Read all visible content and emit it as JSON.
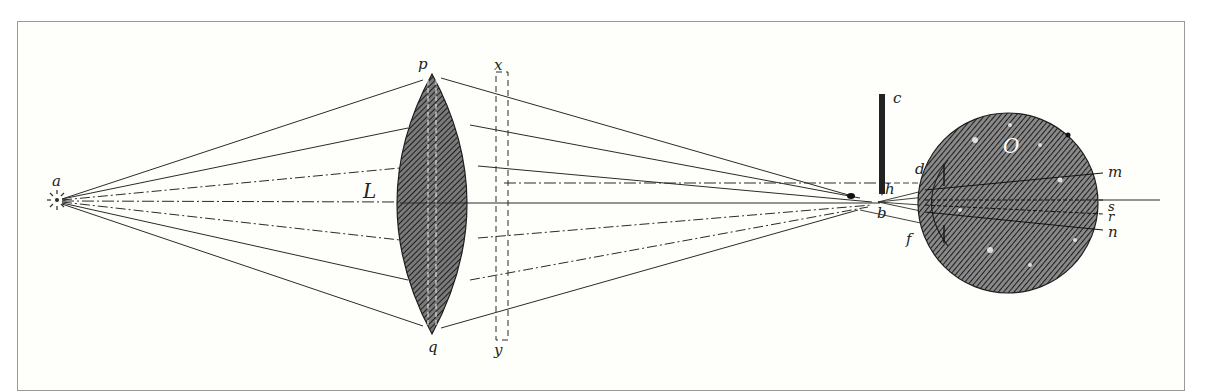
{
  "figure": {
    "frame_color": "#9a9a96",
    "background": "#fefefb",
    "ink": "#2a2a2a"
  },
  "labels": {
    "source": "a",
    "lens": "L",
    "lens_top": "p",
    "lens_bottom": "q",
    "screen_top": "x",
    "screen_bottom": "y",
    "rod": "c",
    "focus_upper": "h",
    "focus_lower": "b",
    "iris_upper": "d",
    "iris_lower": "f",
    "eye": "O",
    "eye_label_m": "m",
    "eye_label_s": "s",
    "eye_label_r": "r",
    "eye_label_n": "n",
    "lens_inner": "g"
  },
  "elements": {
    "point_source": {
      "name": "a",
      "x": 57,
      "y": 200
    },
    "lens": {
      "name": "L",
      "cx": 432,
      "top": 75,
      "bottom": 332,
      "half_width": 40
    },
    "screen": {
      "name": "x-y",
      "x1": 496,
      "x2": 508,
      "top": 85,
      "bottom": 338
    },
    "rod": {
      "name": "c",
      "x": 882,
      "top": 94,
      "bottom": 194
    },
    "focus_point": {
      "x": 878,
      "y": 202
    },
    "eye": {
      "name": "O",
      "cx": 1008,
      "cy": 200,
      "r": 90
    },
    "optical_axis_end": 1160
  }
}
